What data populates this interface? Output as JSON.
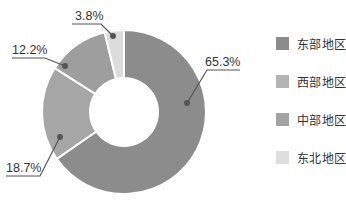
{
  "chart_data": {
    "type": "pie",
    "subtype": "donut",
    "title": "",
    "categories": [
      "东部地区",
      "西部地区",
      "中部地区",
      "东北地区"
    ],
    "values": [
      65.3,
      18.7,
      12.2,
      3.8
    ],
    "unit": "%",
    "labels": [
      "65.3%",
      "18.7%",
      "12.2%",
      "3.8%"
    ],
    "colors": [
      "#8c8c8c",
      "#a6a6a6",
      "#9e9e9e",
      "#dcdcdc"
    ],
    "start_angle_deg": 0,
    "direction": "clockwise",
    "legend_position": "right"
  },
  "legend": {
    "items": [
      {
        "label": "东部地区",
        "color": "#8c8c8c"
      },
      {
        "label": "西部地区",
        "color": "#b4b4b4"
      },
      {
        "label": "中部地区",
        "color": "#a3a3a3"
      },
      {
        "label": "东北地区",
        "color": "#dedede"
      }
    ]
  }
}
